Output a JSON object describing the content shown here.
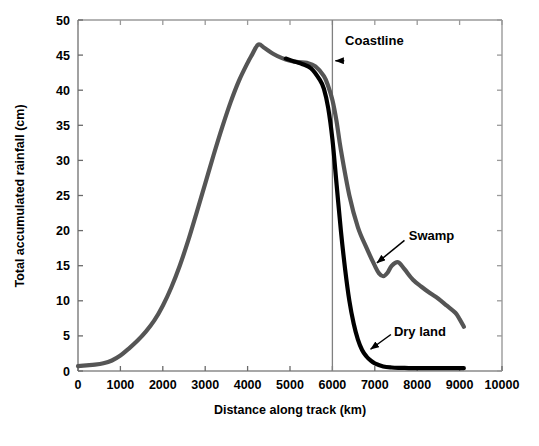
{
  "chart_data": {
    "type": "line",
    "title": "",
    "xlabel": "Distance along track (km)",
    "ylabel": "Total accumulated rainfall (cm)",
    "xlim": [
      0,
      10000
    ],
    "ylim": [
      0,
      50
    ],
    "xticks": [
      0,
      1000,
      2000,
      3000,
      4000,
      5000,
      6000,
      7000,
      8000,
      9000,
      10000
    ],
    "yticks": [
      0,
      5,
      10,
      15,
      20,
      25,
      30,
      35,
      40,
      45,
      50
    ],
    "xtick_labels": [
      "0",
      "1000",
      "2000",
      "3000",
      "4000",
      "5000",
      "6000",
      "7000",
      "8000",
      "9000",
      "10000"
    ],
    "ytick_labels": [
      "0",
      "5",
      "10",
      "15",
      "20",
      "25",
      "30",
      "35",
      "40",
      "45",
      "50"
    ],
    "grid": false,
    "legend": "none",
    "series": [
      {
        "name": "Swamp",
        "color": "#555555",
        "linewidth": 4.2,
        "x": [
          0,
          200,
          400,
          600,
          800,
          1000,
          1200,
          1400,
          1600,
          1800,
          2000,
          2200,
          2400,
          2600,
          2800,
          3000,
          3200,
          3400,
          3600,
          3800,
          4000,
          4100,
          4250,
          4400,
          4600,
          4800,
          5000,
          5200,
          5400,
          5600,
          5800,
          5900,
          6000,
          6100,
          6200,
          6400,
          6600,
          6800,
          7000,
          7100,
          7200,
          7300,
          7400,
          7550,
          7700,
          7900,
          8100,
          8300,
          8500,
          8700,
          8900,
          9000,
          9100
        ],
        "y": [
          0.7,
          0.8,
          0.9,
          1.1,
          1.5,
          2.2,
          3.2,
          4.3,
          5.6,
          7.2,
          9.3,
          11.9,
          15.0,
          18.6,
          22.6,
          26.7,
          30.8,
          34.7,
          38.3,
          41.4,
          43.9,
          45.0,
          46.5,
          46.0,
          45.2,
          44.6,
          44.2,
          44.0,
          43.9,
          43.4,
          42.0,
          40.6,
          38.6,
          35.5,
          31.5,
          25.0,
          20.5,
          17.6,
          15.0,
          13.9,
          13.5,
          14.0,
          15.0,
          15.5,
          14.5,
          13.0,
          12.0,
          11.1,
          10.3,
          9.3,
          8.3,
          7.4,
          6.3
        ]
      },
      {
        "name": "Dry land",
        "color": "#000000",
        "linewidth": 4.2,
        "x": [
          4900,
          5100,
          5300,
          5500,
          5700,
          5800,
          5900,
          6000,
          6100,
          6200,
          6300,
          6400,
          6500,
          6600,
          6700,
          6800,
          6900,
          7000,
          7200,
          7400,
          7600,
          7800,
          8000,
          8300,
          8600,
          8900,
          9100
        ],
        "y": [
          44.5,
          44.1,
          43.7,
          43.1,
          41.5,
          40.2,
          37.5,
          33.0,
          26.5,
          20.0,
          14.5,
          10.0,
          6.8,
          4.5,
          3.0,
          2.1,
          1.5,
          1.1,
          0.65,
          0.5,
          0.45,
          0.42,
          0.4,
          0.4,
          0.4,
          0.4,
          0.4
        ]
      }
    ],
    "annotations": [
      {
        "name": "coastline",
        "label": "Coastline",
        "label_x": 6300,
        "label_y": 47.0,
        "arrow_from_x": 6280,
        "arrow_from_y": 44.2,
        "arrow_to_x": 6070,
        "arrow_to_y": 44.2
      },
      {
        "name": "swamp",
        "label": "Swamp",
        "label_x": 7800,
        "label_y": 19.2,
        "arrow_from_x": 7700,
        "arrow_from_y": 18.6,
        "arrow_to_x": 7050,
        "arrow_to_y": 15.4
      },
      {
        "name": "dry-land",
        "label": "Dry land",
        "label_x": 7450,
        "label_y": 5.6,
        "arrow_from_x": 7380,
        "arrow_from_y": 5.2,
        "arrow_to_x": 6900,
        "arrow_to_y": 3.1
      }
    ],
    "reference_lines": [
      {
        "name": "coastline-marker",
        "orientation": "vertical",
        "x": 6000,
        "color": "#808080"
      }
    ]
  }
}
